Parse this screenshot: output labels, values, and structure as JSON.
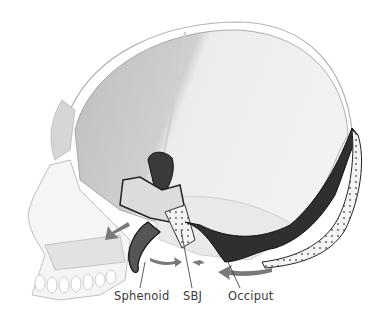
{
  "figure": {
    "labels": [
      {
        "id": "sphenoid",
        "text": "Sphenoid",
        "x": 114,
        "y": 289
      },
      {
        "id": "sbj",
        "text": "SBJ",
        "x": 183,
        "y": 289
      },
      {
        "id": "occiput",
        "text": "Occiput",
        "x": 228,
        "y": 289
      }
    ],
    "arrows": [
      {
        "id": "sphenoid-anterior-arrow",
        "direction": "down-left"
      },
      {
        "id": "sbj-flexion-arrow-left",
        "direction": "right"
      },
      {
        "id": "sbj-flexion-arrow-right",
        "direction": "left"
      },
      {
        "id": "occiput-arrow",
        "direction": "left"
      }
    ],
    "colors": {
      "background": "#ffffff",
      "skull_light": "#e6e6e6",
      "skull_shade": "#c9c9c9",
      "bone_dark": "#2e2e2e",
      "bone_mid": "#6a6a6a",
      "arrow": "#7a7a7a",
      "label_text": "#3a3a3a"
    }
  }
}
